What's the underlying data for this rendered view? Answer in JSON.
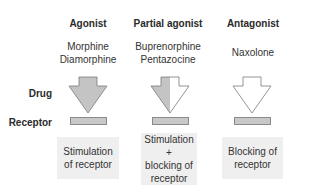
{
  "columns": [
    {
      "header": "Agonist",
      "drugs": [
        "Morphine",
        "Diamorphine"
      ],
      "arrow_fill": "full",
      "effect": [
        "Stimulation",
        "of receptor"
      ]
    },
    {
      "header": "Partial agonist",
      "drugs": [
        "Buprenorphine",
        "Pentazocine"
      ],
      "arrow_fill": "half",
      "effect": [
        "Stimulation +",
        "blocking of",
        "receptor"
      ]
    },
    {
      "header": "Antagonist",
      "drugs": [
        "Naxolone"
      ],
      "arrow_fill": "none",
      "effect": [
        "Blocking of",
        "receptor"
      ]
    }
  ],
  "row_labels": {
    "drug": "Drug",
    "receptor": "Receptor"
  },
  "colors": {
    "arrow_fill": "#c4c4c4",
    "arrow_stroke": "#7a7a7a",
    "receptor_fill": "#c8c8c8",
    "effect_box": "#efefef"
  }
}
